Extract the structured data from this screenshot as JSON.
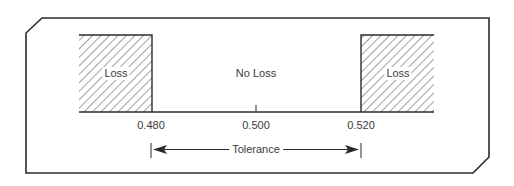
{
  "diagram": {
    "regions": [
      {
        "id": "left-loss",
        "label": "Loss",
        "hatched": true
      },
      {
        "id": "center",
        "label": "No Loss",
        "hatched": false
      },
      {
        "id": "right-loss",
        "label": "Loss",
        "hatched": true
      }
    ],
    "axis": {
      "ticks": [
        {
          "value": "0.480"
        },
        {
          "value": "0.500"
        },
        {
          "value": "0.520"
        }
      ]
    },
    "tolerance": {
      "label": "Tolerance"
    },
    "colors": {
      "line": "#2b2b2b",
      "hatch": "#444444",
      "text": "#3a3a3a",
      "background": "#ffffff"
    }
  }
}
